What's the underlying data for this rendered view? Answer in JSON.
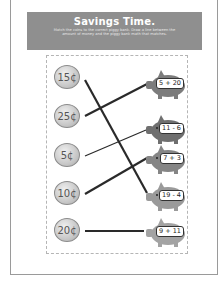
{
  "worksheet": {
    "title": "Savings Time.",
    "instructions": "Match the coins to the correct piggy bank. Draw a line between the amount of money and the piggy bank math that matches."
  },
  "coins": [
    {
      "label": "15¢",
      "value": 15
    },
    {
      "label": "25¢",
      "value": 25
    },
    {
      "label": "5¢",
      "value": 5
    },
    {
      "label": "10¢",
      "value": 10
    },
    {
      "label": "20¢",
      "value": 20
    }
  ],
  "piggy_banks": [
    {
      "label": "5 + 20",
      "color": "#7c7c7c"
    },
    {
      "label": "11 - 6",
      "color": "#6f6f6f"
    },
    {
      "label": "7 + 3",
      "color": "#858585"
    },
    {
      "label": "19 - 4",
      "color": "#9a9a9a"
    },
    {
      "label": "9 + 11",
      "color": "#a3a3a3"
    }
  ],
  "matches": [
    {
      "coin": "15¢",
      "piggy": "19 - 4"
    },
    {
      "coin": "25¢",
      "piggy": "5 + 20"
    },
    {
      "coin": "5¢",
      "piggy": "11 - 6"
    },
    {
      "coin": "10¢",
      "piggy": "7 + 3"
    },
    {
      "coin": "20¢",
      "piggy": "9 + 11"
    }
  ],
  "colors": {
    "header_bg": "#8f8f8f",
    "line": "#2a2a2a"
  }
}
